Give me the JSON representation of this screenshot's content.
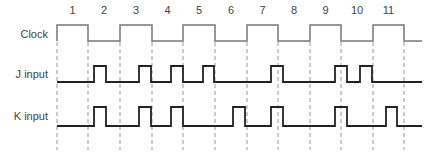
{
  "diagram": {
    "title": "",
    "period_numbers": [
      "1",
      "2",
      "3",
      "4",
      "5",
      "6",
      "7",
      "8",
      "9",
      "10",
      "11"
    ],
    "signals": [
      {
        "name": "Clock",
        "label": "Clock"
      },
      {
        "name": "J",
        "label": "J input"
      },
      {
        "name": "K",
        "label": "K input"
      }
    ],
    "colors": {
      "clock": "#777777",
      "jk": "#222222",
      "dash": "#999999",
      "text": "#444444"
    }
  }
}
